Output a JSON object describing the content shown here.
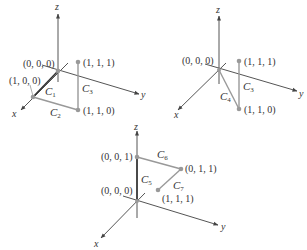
{
  "figure": {
    "colors": {
      "axis": "#555555",
      "path_dark": "#333333",
      "path_gray": "#999999",
      "point": "#999999",
      "text": "#333333"
    },
    "panels": [
      {
        "id": "panel-1",
        "axes": {
          "x": "x",
          "y": "y",
          "z": "z"
        },
        "points": [
          {
            "label": "(0, 0, 0)"
          },
          {
            "label": "(1, 0, 0)"
          },
          {
            "label": "(1, 1, 1)"
          },
          {
            "label": "(1, 1, 0)"
          }
        ],
        "curves": [
          {
            "name": "C",
            "sub": "1",
            "from": "(0, 0, 0)",
            "to": "(1, 0, 0)"
          },
          {
            "name": "C",
            "sub": "2",
            "from": "(1, 0, 0)",
            "to": "(1, 1, 0)"
          },
          {
            "name": "C",
            "sub": "3",
            "from": "(1, 1, 0)",
            "to": "(1, 1, 1)"
          }
        ]
      },
      {
        "id": "panel-2",
        "axes": {
          "x": "x",
          "y": "y",
          "z": "z"
        },
        "points": [
          {
            "label": "(0, 0, 0)"
          },
          {
            "label": "(1, 1, 1)"
          },
          {
            "label": "(1, 1, 0)"
          }
        ],
        "curves": [
          {
            "name": "C",
            "sub": "4",
            "from": "(0, 0, 0)",
            "to": "(1, 1, 0)"
          },
          {
            "name": "C",
            "sub": "3",
            "from": "(1, 1, 0)",
            "to": "(1, 1, 1)"
          }
        ]
      },
      {
        "id": "panel-3",
        "axes": {
          "x": "x",
          "y": "y",
          "z": "z"
        },
        "points": [
          {
            "label": "(0, 0, 1)"
          },
          {
            "label": "(0, 1, 1)"
          },
          {
            "label": "(0, 0, 0)"
          },
          {
            "label": "(1, 1, 1)"
          }
        ],
        "curves": [
          {
            "name": "C",
            "sub": "5",
            "from": "(0, 0, 0)",
            "to": "(0, 0, 1)"
          },
          {
            "name": "C",
            "sub": "6",
            "from": "(0, 0, 1)",
            "to": "(0, 1, 1)"
          },
          {
            "name": "C",
            "sub": "7",
            "from": "(0, 1, 1)",
            "to": "(1, 1, 1)"
          }
        ]
      }
    ]
  }
}
